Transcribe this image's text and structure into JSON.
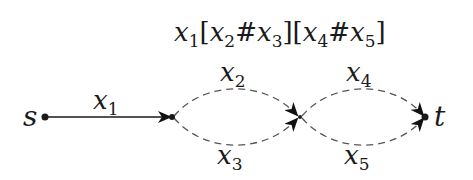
{
  "diagram": {
    "formula": {
      "parts": [
        {
          "var": "x",
          "sub": "1"
        },
        {
          "text": "["
        },
        {
          "var": "x",
          "sub": "2"
        },
        {
          "text": "#"
        },
        {
          "var": "x",
          "sub": "3"
        },
        {
          "text": "]["
        },
        {
          "var": "x",
          "sub": "4"
        },
        {
          "text": "#"
        },
        {
          "var": "x",
          "sub": "5"
        },
        {
          "text": "]"
        }
      ],
      "full": "x1[x2#x3][x4#x5]"
    },
    "nodes": [
      {
        "id": "s",
        "label": "s"
      },
      {
        "id": "v1",
        "label": ""
      },
      {
        "id": "v2",
        "label": ""
      },
      {
        "id": "t",
        "label": "t"
      }
    ],
    "edges": [
      {
        "id": "e1",
        "from": "s",
        "to": "v1",
        "var": "x",
        "sub": "1",
        "style": "solid"
      },
      {
        "id": "e2",
        "from": "v1",
        "to": "v2",
        "var": "x",
        "sub": "2",
        "style": "dashed",
        "position": "upper"
      },
      {
        "id": "e3",
        "from": "v1",
        "to": "v2",
        "var": "x",
        "sub": "3",
        "style": "dashed",
        "position": "lower"
      },
      {
        "id": "e4",
        "from": "v2",
        "to": "t",
        "var": "x",
        "sub": "4",
        "style": "dashed",
        "position": "upper"
      },
      {
        "id": "e5",
        "from": "v2",
        "to": "t",
        "var": "x",
        "sub": "5",
        "style": "dashed",
        "position": "lower"
      }
    ],
    "colors": {
      "stroke": "#1a1a1a",
      "dashed": "#555555"
    }
  }
}
